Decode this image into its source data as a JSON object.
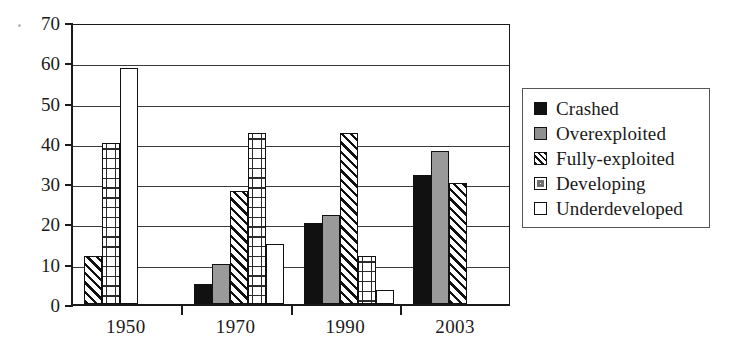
{
  "chart_data": {
    "type": "bar",
    "title": "",
    "xlabel": "",
    "ylabel": "",
    "ylim": [
      0,
      70
    ],
    "yticks": [
      0,
      10,
      20,
      30,
      40,
      50,
      60,
      70
    ],
    "grid": true,
    "legend_position": "right",
    "categories": [
      "1950",
      "1970",
      "1990",
      "2003"
    ],
    "series": [
      {
        "name": "Crashed",
        "pattern": "solid-black",
        "color": "#111111",
        "values": [
          null,
          5,
          20,
          32
        ]
      },
      {
        "name": "Overexploited",
        "pattern": "solid-gray",
        "color": "#9a9a9a",
        "values": [
          null,
          10,
          22,
          38
        ]
      },
      {
        "name": "Fully-exploited",
        "pattern": "diagonal-hatch",
        "color": "#111111",
        "values": [
          12,
          28,
          42.5,
          30
        ]
      },
      {
        "name": "Developing",
        "pattern": "dotted-brick",
        "color": "#2b2b2b",
        "values": [
          40,
          42.5,
          12,
          null
        ]
      },
      {
        "name": "Underdeveloped",
        "pattern": "empty-white",
        "color": "#ffffff",
        "values": [
          58.5,
          15,
          3.5,
          null
        ]
      }
    ]
  },
  "legend": {
    "items": [
      {
        "label": "Crashed"
      },
      {
        "label": "Overexploited"
      },
      {
        "label": "Fully-exploited"
      },
      {
        "label": "Developing"
      },
      {
        "label": "Underdeveloped"
      }
    ]
  },
  "axis": {
    "y_tick_labels": [
      "0",
      "10",
      "20",
      "30",
      "40",
      "50",
      "60",
      "70"
    ],
    "x_tick_labels": [
      "1950",
      "1970",
      "1990",
      "2003"
    ]
  }
}
